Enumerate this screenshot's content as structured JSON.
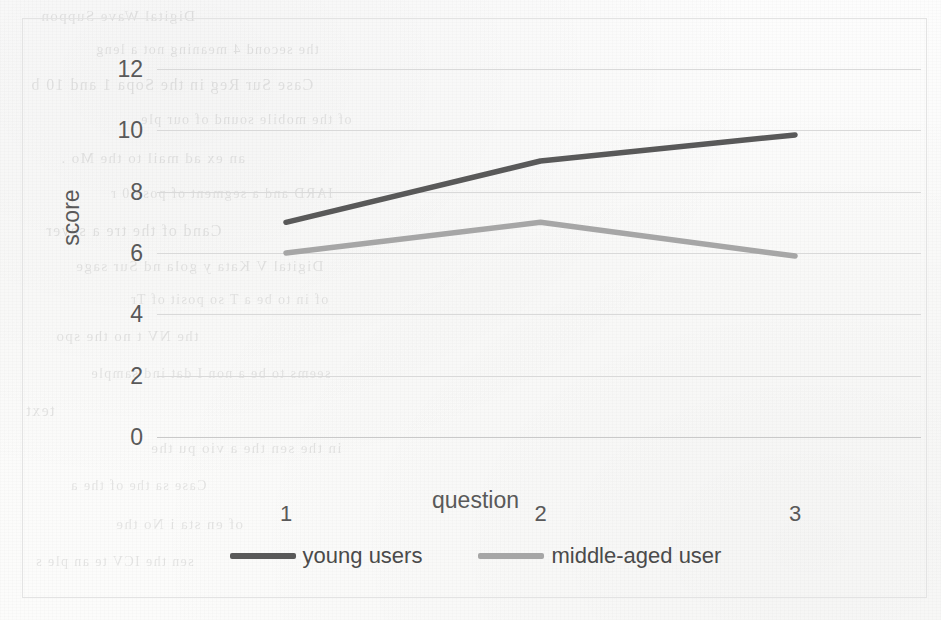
{
  "chart_data": {
    "type": "line",
    "title": "",
    "xlabel": "question",
    "ylabel": "score",
    "categories": [
      "1",
      "2",
      "3"
    ],
    "x": [
      1,
      2,
      3
    ],
    "xlim": [
      1,
      3
    ],
    "ylim": [
      0,
      12
    ],
    "yticks": [
      0,
      2,
      4,
      6,
      8,
      10,
      12
    ],
    "ytick_labels": [
      "0",
      "2",
      "4",
      "6",
      "8",
      "10",
      "12"
    ],
    "grid": "horizontal",
    "legend_position": "bottom",
    "series": [
      {
        "name": "young users",
        "color": "#595959",
        "values": [
          7,
          9,
          9.85
        ]
      },
      {
        "name": "middle-aged user",
        "color": "#a6a6a6",
        "values": [
          6,
          7,
          5.9
        ]
      }
    ]
  },
  "legend": {
    "items": [
      {
        "label": "young users",
        "color": "#595959"
      },
      {
        "label": "middle-aged user",
        "color": "#a6a6a6"
      }
    ]
  },
  "axes": {
    "y_title": "score",
    "x_title": "question",
    "y_tick_labels": [
      "12",
      "10",
      "8",
      "6",
      "4",
      "2",
      "0"
    ],
    "x_tick_labels": [
      "1",
      "2",
      "3"
    ]
  },
  "appearance": {
    "background": "#fdfdfd",
    "gridline_color": "#d9d9d9",
    "border_color": "#e3e3e3",
    "tick_text_color": "#595959"
  },
  "bleed_through_text": [
    "Digital Wave Suppon",
    "the second 4 meaning not a  leng",
    "Case Sur Reg in the Sopa 1 and 10 b",
    "of the mobile sound of our ple",
    "an ex ad mail to the  Mo .",
    "IARD and a segment of  pose  0 r",
    "Cand of the tre a  sever",
    "Digital V Kata  y  gola  nd Sur  sage",
    "of in to be a  T  so posit of  Tr",
    "the   NV  t    no  the  spo",
    "seems to be a non  I dat  ind  sample",
    "text",
    "in the  sen  the a  vio  pu  the",
    "Case  sa  the  of  the  a",
    "of  en  sta  i  No  the",
    "sen  the  ICV  te  an  ple  s"
  ]
}
